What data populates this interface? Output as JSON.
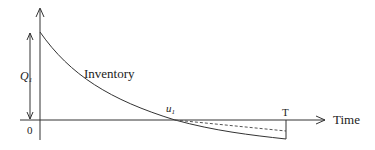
{
  "diagram": {
    "type": "inventory-level-over-time",
    "labels": {
      "inventory": "Inventory",
      "time_axis": "Time",
      "origin": "0",
      "initial_quantity": "Q",
      "initial_quantity_sub": "1",
      "zero_crossing": "u",
      "zero_crossing_sub": "1",
      "cycle_end": "T"
    },
    "colors": {
      "line": "#333333",
      "background": "#ffffff"
    }
  }
}
